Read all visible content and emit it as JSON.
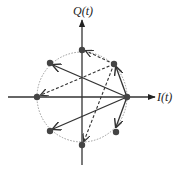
{
  "diagram": {
    "axes": {
      "x_label": "I(t)",
      "y_label": "Q(t)"
    },
    "colors": {
      "axis": "#333333",
      "points": "#444444",
      "circle": "#999999",
      "arrows": "#333333"
    },
    "center": [
      82,
      97
    ],
    "radius": 45,
    "constellation_points_deg": [
      0,
      45,
      90,
      135,
      180,
      225,
      270,
      315
    ],
    "solid_arrows": [
      {
        "from_deg": 0,
        "to_deg": 45
      },
      {
        "from_deg": 0,
        "to_deg": 135
      },
      {
        "from_deg": 0,
        "to_deg": 225
      },
      {
        "from_deg": 0,
        "to_deg": 315
      }
    ],
    "dashed_arrows": [
      {
        "from_deg": 45,
        "to_deg": 90
      },
      {
        "from_deg": 45,
        "to_deg": 180
      },
      {
        "from_deg": 45,
        "to_deg": 270
      }
    ]
  }
}
